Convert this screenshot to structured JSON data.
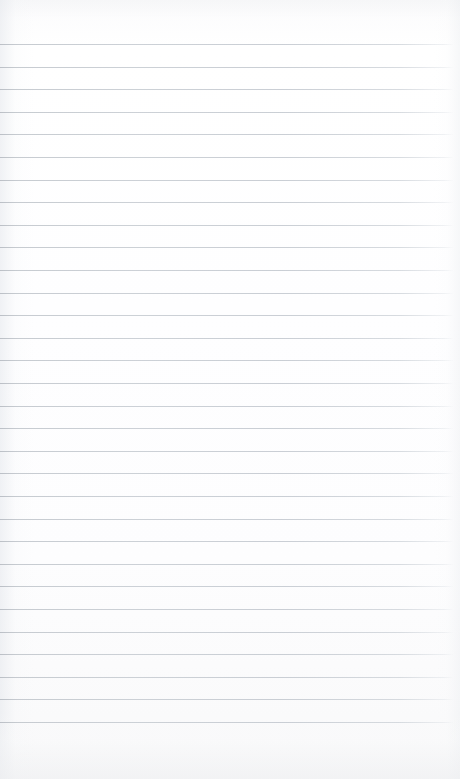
{
  "document": {
    "type": "scanned-ruled-notebook-page",
    "title": "Blank ruled notebook page",
    "page_width": 460,
    "page_height": 779,
    "content_text": "",
    "is_blank": true,
    "handwriting_present": false,
    "printed_text_present": false
  },
  "paper": {
    "background_color": "#fdfdfd",
    "edge_tint_color": "#eceef1",
    "top_margin_px": 44,
    "bottom_margin_px": 56,
    "left_margin_px": 0,
    "right_margin_px": 7
  },
  "ruling": {
    "style": "horizontal-ruled",
    "line_color": "#c8ccd2",
    "line_thickness_px": 1,
    "line_spacing_px": 22.6,
    "first_line_y_px": 44,
    "last_line_y_px": 723,
    "line_start_x_px": 0,
    "line_end_x_px": 453,
    "line_count": 31,
    "vertical_margin_rule": false,
    "line_y_positions": [
      44,
      66.6,
      89.3,
      111.9,
      134.5,
      157.1,
      179.8,
      202.4,
      225.0,
      247.6,
      270.3,
      292.9,
      315.5,
      338.1,
      360.8,
      383.4,
      406.0,
      428.6,
      451.3,
      473.9,
      473.9,
      496.5,
      519.1,
      541.8,
      564.4,
      587.0,
      609.6,
      632.3,
      654.9,
      677.5,
      700.1,
      722.8
    ]
  },
  "writing_lines": [
    {
      "index": 1,
      "text": ""
    },
    {
      "index": 2,
      "text": ""
    },
    {
      "index": 3,
      "text": ""
    },
    {
      "index": 4,
      "text": ""
    },
    {
      "index": 5,
      "text": ""
    },
    {
      "index": 6,
      "text": ""
    },
    {
      "index": 7,
      "text": ""
    },
    {
      "index": 8,
      "text": ""
    },
    {
      "index": 9,
      "text": ""
    },
    {
      "index": 10,
      "text": ""
    },
    {
      "index": 11,
      "text": ""
    },
    {
      "index": 12,
      "text": ""
    },
    {
      "index": 13,
      "text": ""
    },
    {
      "index": 14,
      "text": ""
    },
    {
      "index": 15,
      "text": ""
    },
    {
      "index": 16,
      "text": ""
    },
    {
      "index": 17,
      "text": ""
    },
    {
      "index": 18,
      "text": ""
    },
    {
      "index": 19,
      "text": ""
    },
    {
      "index": 20,
      "text": ""
    },
    {
      "index": 21,
      "text": ""
    },
    {
      "index": 22,
      "text": ""
    },
    {
      "index": 23,
      "text": ""
    },
    {
      "index": 24,
      "text": ""
    },
    {
      "index": 25,
      "text": ""
    },
    {
      "index": 26,
      "text": ""
    },
    {
      "index": 27,
      "text": ""
    },
    {
      "index": 28,
      "text": ""
    },
    {
      "index": 29,
      "text": ""
    },
    {
      "index": 30,
      "text": ""
    },
    {
      "index": 31,
      "text": ""
    }
  ]
}
